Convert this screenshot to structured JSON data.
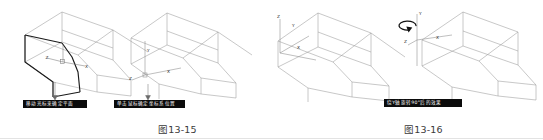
{
  "page": {
    "background": "#ffffff",
    "width": 543,
    "height": 140
  },
  "figures": [
    {
      "id": "fig-13-15",
      "caption": "图13-15",
      "panels": [
        {
          "id": "panel-1",
          "callout": "移动光标来确定平面",
          "ucs_icon": "ucs-axis-tripod",
          "axes": [
            "Z",
            "X"
          ],
          "highlight": "cross-section-plane",
          "shape": "sloped-bin-wireframe"
        },
        {
          "id": "panel-2",
          "callout": "单击鼠标确定坐标系位置",
          "ucs_icon": "ucs-axis-tripod",
          "axes": [
            "Y",
            "X",
            "Z"
          ],
          "shape": "sloped-bin-wireframe"
        }
      ]
    },
    {
      "id": "fig-13-16",
      "caption": "图13-16",
      "panels": [
        {
          "id": "panel-3",
          "callout": "",
          "ucs_icon": "ucs-axis-tripod",
          "axes": [
            "Z",
            "Y",
            "X"
          ],
          "shape": "sloped-bin-wireframe"
        },
        {
          "id": "panel-4",
          "callout": "绕Y轴旋转90°后的效果",
          "ucs_icon": "ucs-axis-tripod-with-rotation-arrow",
          "axes": [
            "Y",
            "X",
            "Z"
          ],
          "rotation_arrow": "curved-arrow-about-y",
          "shape": "sloped-bin-wireframe"
        }
      ]
    }
  ],
  "axis_labels": {
    "x": "X",
    "y": "Y",
    "z": "Z"
  },
  "colors": {
    "wireframe": "#9a9a9a",
    "wireframe_dark": "#1a1a1a",
    "callout_bg": "#0b0b0b",
    "callout_fg": "#ffffff",
    "caption": "#3a3a3a",
    "rule": "#e3e3e3"
  }
}
